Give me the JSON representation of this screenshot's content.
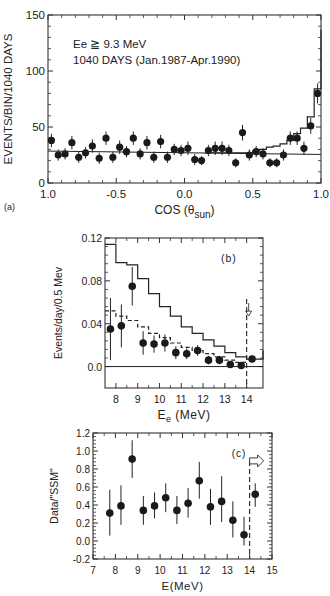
{
  "chart_data": [
    {
      "id": "a",
      "type": "scatter",
      "panel_label": "(a)",
      "title": "",
      "annotation_lines": [
        "Ee ≧ 9.3 MeV",
        "1040 DAYS (Jan.1987-Apr.1990)"
      ],
      "xlabel": "COS (θsun)",
      "xlabel_main": "COS (θ",
      "xlabel_sub": "sun",
      "xlabel_close": ")",
      "ylabel": "EVENTS/BIN/1040 DAYS",
      "xlim": [
        -1.0,
        1.0
      ],
      "ylim": [
        0,
        150
      ],
      "xticks": [
        -1.0,
        -0.5,
        0.0,
        0.5,
        1.0
      ],
      "xtick_labels": [
        "1.0",
        "-0.5",
        "0.0",
        "0.5",
        "1.0"
      ],
      "yticks": [
        0,
        50,
        100,
        150
      ],
      "ytick_labels": [
        "0",
        "50",
        "100",
        "150"
      ],
      "grid": false,
      "series": [
        {
          "name": "data",
          "style": "points_with_errorbars",
          "x": [
            -0.975,
            -0.925,
            -0.875,
            -0.825,
            -0.775,
            -0.725,
            -0.675,
            -0.625,
            -0.575,
            -0.525,
            -0.475,
            -0.425,
            -0.375,
            -0.325,
            -0.275,
            -0.225,
            -0.175,
            -0.125,
            -0.075,
            -0.025,
            0.025,
            0.075,
            0.125,
            0.175,
            0.225,
            0.275,
            0.325,
            0.375,
            0.425,
            0.475,
            0.525,
            0.575,
            0.625,
            0.675,
            0.725,
            0.775,
            0.825,
            0.875,
            0.925,
            0.975
          ],
          "y": [
            38,
            25,
            26,
            36,
            23,
            27,
            33,
            22,
            40,
            23,
            32,
            28,
            40,
            26,
            36,
            23,
            37,
            23,
            30,
            29,
            31,
            21,
            20,
            29,
            31,
            31,
            29,
            18,
            45,
            25,
            28,
            26,
            18,
            18,
            25,
            40,
            40,
            31,
            51,
            80
          ],
          "err": [
            6,
            5,
            5,
            6,
            5,
            5,
            6,
            5,
            6,
            5,
            6,
            5,
            6,
            5,
            6,
            5,
            6,
            5,
            5,
            5,
            6,
            5,
            4,
            5,
            6,
            6,
            5,
            4,
            7,
            5,
            5,
            5,
            4,
            4,
            5,
            6,
            6,
            6,
            7,
            9
          ]
        },
        {
          "name": "background (flat)",
          "style": "line",
          "x": [
            -1.0,
            1.0
          ],
          "y": [
            28.5,
            25.5
          ]
        },
        {
          "name": "expected (SSM + background)",
          "style": "step",
          "x_edges": [
            0.15,
            0.5,
            0.55,
            0.6,
            0.65,
            0.7,
            0.75,
            0.8,
            0.85,
            0.9,
            0.95,
            1.0
          ],
          "y": [
            27,
            29,
            30,
            32,
            33,
            35,
            38,
            44,
            49,
            59,
            84,
            137
          ]
        }
      ]
    },
    {
      "id": "b",
      "type": "scatter",
      "panel_label": "(b)",
      "xlabel": "Ee (MeV)",
      "xlabel_main": "E",
      "xlabel_sub": "e",
      "xlabel_rest": " (MeV)",
      "ylabel": "Events/day/0.5 Mev",
      "xlim": [
        7.5,
        14.75
      ],
      "ylim": [
        -0.02,
        0.12
      ],
      "xticks": [
        8,
        9,
        10,
        11,
        12,
        13,
        14
      ],
      "xtick_labels": [
        "8",
        "9",
        "10",
        "11",
        "12",
        "13",
        "14"
      ],
      "yticks": [
        0.0,
        0.04,
        0.08,
        0.12
      ],
      "ytick_labels": [
        "0.0",
        "0.04",
        "0.08",
        "0.12"
      ],
      "grid": false,
      "threshold_marker": {
        "x": 14.0,
        "arrow": "right"
      },
      "series": [
        {
          "name": "data",
          "style": "points_with_errorbars",
          "x": [
            7.75,
            8.25,
            8.75,
            9.25,
            9.75,
            10.25,
            10.75,
            11.25,
            11.75,
            12.25,
            12.75,
            13.25,
            13.75,
            14.25
          ],
          "y": [
            0.035,
            0.038,
            0.075,
            0.022,
            0.021,
            0.022,
            0.013,
            0.012,
            0.015,
            0.006,
            0.006,
            0.002,
            0.001,
            0.007
          ],
          "err": [
            0.029,
            0.02,
            0.018,
            0.011,
            0.008,
            0.008,
            0.006,
            0.005,
            0.005,
            0.004,
            0.004,
            0.002,
            0.001,
            0.001
          ]
        },
        {
          "name": "SSM prediction",
          "style": "step_solid",
          "x_edges": [
            7.5,
            8.0,
            8.5,
            9.0,
            9.5,
            10.0,
            10.5,
            11.0,
            11.5,
            12.0,
            12.5,
            13.0,
            13.5,
            14.0,
            14.75
          ],
          "y": [
            0.114,
            0.097,
            0.095,
            0.082,
            0.068,
            0.056,
            0.047,
            0.037,
            0.031,
            0.025,
            0.019,
            0.013,
            0.009,
            0.007,
            0.015
          ]
        },
        {
          "name": "SSM scaled",
          "style": "step_dashed",
          "x_edges": [
            7.5,
            8.0,
            8.5,
            9.0,
            9.5,
            10.0,
            10.5,
            11.0,
            11.5,
            12.0,
            12.5,
            13.0,
            13.5,
            14.0
          ],
          "y": [
            0.052,
            0.047,
            0.043,
            0.037,
            0.031,
            0.027,
            0.022,
            0.018,
            0.015,
            0.012,
            0.009,
            0.006,
            0.004
          ]
        },
        {
          "name": "zero line",
          "style": "line",
          "x": [
            7.5,
            14.75
          ],
          "y": [
            0.0,
            0.0
          ]
        }
      ]
    },
    {
      "id": "c",
      "type": "scatter",
      "panel_label": "(c)",
      "xlabel": "E(MeV)",
      "ylabel": "Data/\"SSM\"",
      "xlim": [
        7,
        15
      ],
      "ylim": [
        -0.2,
        1.2
      ],
      "xticks": [
        7,
        8,
        9,
        10,
        11,
        12,
        13,
        14,
        15
      ],
      "xtick_labels": [
        "7",
        "8",
        "9",
        "10",
        "11",
        "12",
        "13",
        "14",
        "15"
      ],
      "yticks": [
        -0.2,
        0.0,
        0.2,
        0.4,
        0.6,
        0.8,
        1.0,
        1.2
      ],
      "ytick_labels": [
        "-0.2",
        "0.0",
        "0.2",
        "0.4",
        "0.6",
        "0.8",
        "1.0",
        "1.2"
      ],
      "grid": false,
      "threshold_marker": {
        "x": 14.0,
        "arrow": "right"
      },
      "series": [
        {
          "name": "data/SSM",
          "style": "points_with_errorbars",
          "x": [
            7.75,
            8.25,
            8.75,
            9.25,
            9.75,
            10.25,
            10.75,
            11.25,
            11.75,
            12.25,
            12.75,
            13.25,
            13.75,
            14.25
          ],
          "y": [
            0.31,
            0.39,
            0.91,
            0.34,
            0.39,
            0.48,
            0.34,
            0.42,
            0.67,
            0.38,
            0.44,
            0.23,
            0.07,
            0.52
          ],
          "err_low": [
            0.25,
            0.21,
            0.21,
            0.16,
            0.14,
            0.16,
            0.15,
            0.16,
            0.2,
            0.2,
            0.23,
            0.19,
            0.12,
            0.14
          ],
          "err_high": [
            0.26,
            0.23,
            0.21,
            0.16,
            0.15,
            0.16,
            0.16,
            0.17,
            0.21,
            0.2,
            0.28,
            0.21,
            0.2,
            0.12
          ]
        }
      ]
    }
  ]
}
